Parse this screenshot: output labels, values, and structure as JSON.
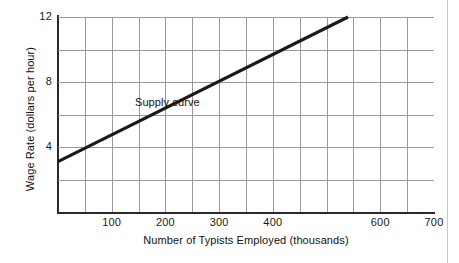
{
  "chart_data": {
    "type": "line",
    "title": "",
    "xlabel": "Number of Typists Employed (thousands)",
    "ylabel": "Wage Rate (dollars per hour)",
    "xlim": [
      0,
      700
    ],
    "ylim": [
      0,
      12
    ],
    "grid": true,
    "x_major_tick_step": 100,
    "x_grid_step": 50,
    "y_tick_step": 4,
    "y_grid_step": 2,
    "legend": "none",
    "xticklabels": [
      {
        "value": 100,
        "label": "100"
      },
      {
        "value": 200,
        "label": "200"
      },
      {
        "value": 300,
        "label": "300"
      },
      {
        "value": 400,
        "label": "400"
      },
      {
        "value": 600,
        "label": "600"
      },
      {
        "value": 700,
        "label": "700"
      }
    ],
    "yticklabels": [
      {
        "value": 4,
        "label": "4"
      },
      {
        "value": 8,
        "label": "8"
      },
      {
        "value": 12,
        "label": "12"
      }
    ],
    "series": [
      {
        "name": "Supply curve",
        "color": "#1a1a1a",
        "points": [
          {
            "x": 0,
            "y": 3.1
          },
          {
            "x": 540,
            "y": 12
          }
        ]
      }
    ],
    "annotations": [
      {
        "text": "Supply curve",
        "x": 255,
        "y": 6.7
      }
    ]
  },
  "axis": {
    "y_title": "Wage Rate (dollars per hour)",
    "x_title": "Number of Typists Employed (thousands)"
  },
  "labels": {
    "x_100": "100",
    "x_200": "200",
    "x_300": "300",
    "x_400": "400",
    "x_600": "600",
    "x_700": "700",
    "y_4": "4",
    "y_8": "8",
    "y_12": "12",
    "supply_curve": "Supply curve"
  },
  "colors": {
    "curve": "#1a1a1a",
    "grid": "#9a9a9a",
    "axis": "#2b2b2b",
    "background": "#ffffff"
  }
}
